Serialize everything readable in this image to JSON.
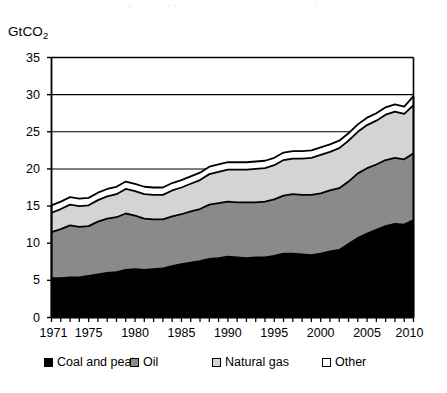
{
  "chart_data": {
    "type": "area",
    "title": "",
    "subtitle": "",
    "xlabel": "",
    "ylabel": "GtCO2",
    "ylabel_display": "GtCO",
    "ylabel_sub": "2",
    "stacked": true,
    "grid": true,
    "grid_axis": "y",
    "legend_position": "bottom",
    "xlim": [
      1971,
      2010
    ],
    "ylim": [
      0,
      35
    ],
    "yticks": [
      0,
      5,
      10,
      15,
      20,
      25,
      30,
      35
    ],
    "ytick_labels": [
      "0",
      "5",
      "10",
      "15",
      "20",
      "25",
      "30",
      "35"
    ],
    "xticks": [
      1971,
      1975,
      1980,
      1985,
      1990,
      1995,
      2000,
      2005,
      2010
    ],
    "xtick_labels": [
      "1971",
      "1975",
      "1980",
      "1985",
      "1990",
      "1995",
      "2000",
      "2005",
      "2010"
    ],
    "x_minor_tick_interval": 1,
    "x": [
      1971,
      1972,
      1973,
      1974,
      1975,
      1976,
      1977,
      1978,
      1979,
      1980,
      1981,
      1982,
      1983,
      1984,
      1985,
      1986,
      1987,
      1988,
      1989,
      1990,
      1991,
      1992,
      1993,
      1994,
      1995,
      1996,
      1997,
      1998,
      1999,
      2000,
      2001,
      2002,
      2003,
      2004,
      2005,
      2006,
      2007,
      2008,
      2009,
      2010
    ],
    "series": [
      {
        "name": "Coal and peat",
        "color": "#000000",
        "values": [
          5.3,
          5.3,
          5.4,
          5.4,
          5.6,
          5.8,
          6.0,
          6.1,
          6.4,
          6.5,
          6.4,
          6.5,
          6.6,
          6.9,
          7.2,
          7.4,
          7.6,
          7.9,
          8.0,
          8.2,
          8.1,
          8.0,
          8.1,
          8.1,
          8.3,
          8.6,
          8.6,
          8.5,
          8.4,
          8.6,
          8.9,
          9.1,
          9.9,
          10.7,
          11.3,
          11.8,
          12.3,
          12.6,
          12.5,
          13.1
        ]
      },
      {
        "name": "Oil",
        "color": "#8a8a8a",
        "values": [
          6.2,
          6.6,
          7.0,
          6.8,
          6.7,
          7.1,
          7.3,
          7.4,
          7.6,
          7.2,
          6.9,
          6.7,
          6.6,
          6.7,
          6.7,
          6.9,
          7.0,
          7.3,
          7.4,
          7.4,
          7.4,
          7.5,
          7.4,
          7.5,
          7.6,
          7.8,
          8.0,
          8.0,
          8.1,
          8.1,
          8.2,
          8.3,
          8.4,
          8.7,
          8.8,
          8.8,
          8.9,
          8.9,
          8.8,
          9.0
        ]
      },
      {
        "name": "Natural gas",
        "color": "#d4d4d4",
        "values": [
          2.6,
          2.7,
          2.8,
          2.8,
          2.8,
          2.9,
          3.0,
          3.1,
          3.3,
          3.3,
          3.3,
          3.3,
          3.3,
          3.5,
          3.6,
          3.7,
          3.9,
          4.1,
          4.2,
          4.3,
          4.4,
          4.4,
          4.5,
          4.5,
          4.6,
          4.8,
          4.8,
          4.9,
          5.0,
          5.2,
          5.2,
          5.4,
          5.5,
          5.6,
          5.8,
          5.9,
          6.1,
          6.2,
          6.1,
          6.5
        ]
      },
      {
        "name": "Other",
        "color": "#ffffff",
        "values": [
          1.0,
          1.0,
          1.0,
          1.0,
          1.0,
          1.0,
          1.0,
          1.0,
          1.0,
          1.0,
          1.0,
          1.0,
          1.0,
          1.0,
          1.0,
          1.0,
          1.0,
          1.0,
          1.0,
          1.0,
          1.0,
          1.0,
          1.0,
          1.0,
          1.0,
          1.0,
          1.0,
          1.0,
          1.0,
          1.0,
          1.0,
          1.0,
          1.0,
          1.0,
          1.0,
          1.0,
          1.0,
          1.0,
          1.0,
          1.2
        ]
      }
    ],
    "totals": [
      15.1,
      15.6,
      16.2,
      16.0,
      16.1,
      16.8,
      17.3,
      17.6,
      18.3,
      18.0,
      17.6,
      17.5,
      17.5,
      18.1,
      18.5,
      19.0,
      19.5,
      20.3,
      20.6,
      20.9,
      20.9,
      20.9,
      21.0,
      21.1,
      21.5,
      22.2,
      22.4,
      22.4,
      22.5,
      22.9,
      23.3,
      23.8,
      24.8,
      26.0,
      26.9,
      27.5,
      28.3,
      28.7,
      28.4,
      29.8
    ],
    "legend": [
      {
        "label": "Coal and peat",
        "swatch": "#000000"
      },
      {
        "label": "Oil",
        "swatch": "#8a8a8a"
      },
      {
        "label": "Natural gas",
        "swatch": "#d4d4d4"
      },
      {
        "label": "Other",
        "swatch": "#ffffff"
      }
    ]
  }
}
